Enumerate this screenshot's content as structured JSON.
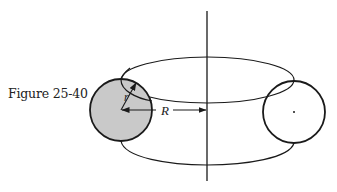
{
  "caption": "Figure 25-40",
  "labels": {
    "small_radius": "r",
    "large_radius": "R"
  },
  "colors": {
    "stroke": "#1a1a1a",
    "cross_section_fill": "#c9c9c9",
    "background": "#ffffff"
  },
  "shapes": {
    "axis": "vertical symmetry axis",
    "torus": "toroid with circular cross-section",
    "left_cross_section": "shaded circle of radius r",
    "right_cross_section": "unshaded circle with center point"
  }
}
